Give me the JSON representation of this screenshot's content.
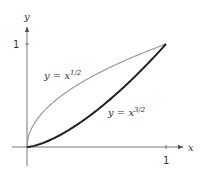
{
  "chart_data": {
    "type": "line",
    "title": "",
    "xlabel": "x",
    "ylabel": "y",
    "xlim": [
      0,
      1
    ],
    "ylim": [
      0,
      1
    ],
    "grid": false,
    "x_ticks": [
      "1"
    ],
    "y_ticks": [
      "1"
    ],
    "series": [
      {
        "name": "y = x^{1/2}",
        "label_base": "y = x",
        "label_exp": "1/2",
        "exponent": 0.5,
        "color": "#9a9a9a",
        "x": [
          0,
          0.05,
          0.1,
          0.2,
          0.3,
          0.4,
          0.5,
          0.6,
          0.7,
          0.8,
          0.9,
          1.0
        ],
        "y": [
          0,
          0.224,
          0.316,
          0.447,
          0.548,
          0.632,
          0.707,
          0.775,
          0.837,
          0.894,
          0.949,
          1.0
        ]
      },
      {
        "name": "y = x^{3/2}",
        "label_base": "y = x",
        "label_exp": "3/2",
        "exponent": 1.5,
        "color": "#222222",
        "x": [
          0,
          0.1,
          0.2,
          0.3,
          0.4,
          0.5,
          0.6,
          0.7,
          0.8,
          0.9,
          1.0
        ],
        "y": [
          0,
          0.032,
          0.089,
          0.164,
          0.253,
          0.354,
          0.465,
          0.586,
          0.716,
          0.854,
          1.0
        ]
      }
    ],
    "annotations": [
      {
        "text": "y = x^{1/2}",
        "x": 0.12,
        "y": 0.72
      },
      {
        "text": "y = x^{3/2}",
        "x": 0.58,
        "y": 0.37
      }
    ]
  }
}
